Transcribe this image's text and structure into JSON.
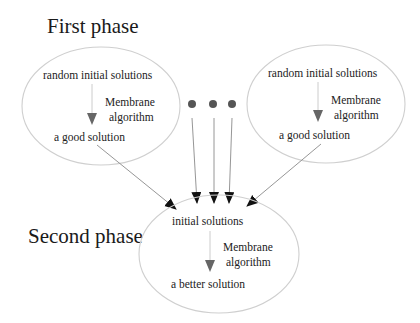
{
  "diagram": {
    "first_phase": {
      "title": "First phase",
      "left_node": {
        "top": "random initial solutions",
        "process_line1": "Membrane",
        "process_line2": "algorithm",
        "bottom": "a good solution"
      },
      "right_node": {
        "top": "random initial solutions",
        "process_line1": "Membrane",
        "process_line2": "algorithm",
        "bottom": "a good solution"
      },
      "ellipsis": "..."
    },
    "second_phase": {
      "title": "Second phase",
      "node": {
        "top": "initial solutions",
        "process_line1": "Membrane",
        "process_line2": "algorithm",
        "bottom": "a better solution"
      }
    },
    "colors": {
      "ellipse_stroke": "#cfcfcf",
      "arrow_head": "#111111",
      "inner_arrow": "#666666",
      "dot": "#555555"
    }
  }
}
